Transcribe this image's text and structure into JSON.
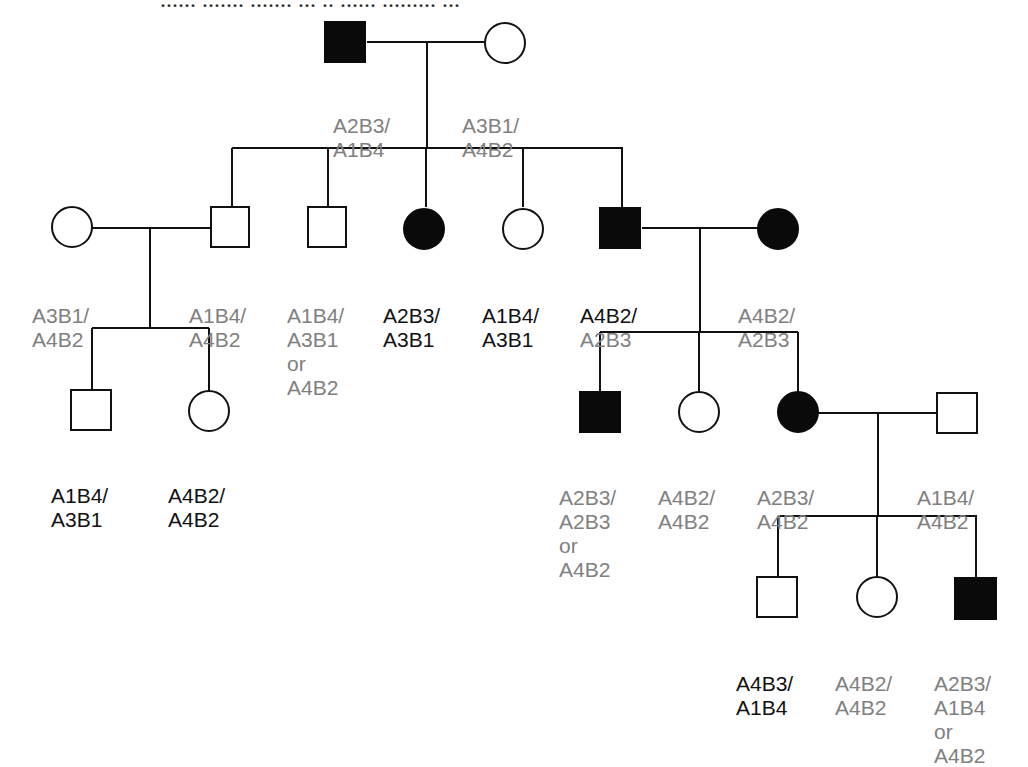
{
  "caption": "...... ....... ....... ... .. ...... ......... ...",
  "colors": {
    "line": "#111111",
    "affected": "#0a0a0a",
    "label_gray": "#808080",
    "label_black": "#111111"
  },
  "individuals": [
    {
      "id": "I1",
      "sex": "male",
      "affected": true,
      "genotype": [
        "A2B3/",
        "A1B4"
      ],
      "tone": [
        "gray",
        "gray"
      ]
    },
    {
      "id": "I2",
      "sex": "female",
      "affected": false,
      "genotype": [
        "A3B1/",
        "A4B2"
      ],
      "tone": [
        "gray",
        "gray"
      ]
    },
    {
      "id": "II1",
      "sex": "female",
      "affected": false,
      "genotype": [
        "A3B1/",
        "A4B2"
      ],
      "tone": [
        "gray",
        "gray"
      ]
    },
    {
      "id": "II2",
      "sex": "male",
      "affected": false,
      "genotype": [
        "A1B4/",
        "A4B2"
      ],
      "tone": [
        "gray",
        "gray"
      ]
    },
    {
      "id": "II3",
      "sex": "male",
      "affected": false,
      "genotype": [
        "A1B4/",
        "A3B1",
        "or",
        "A4B2"
      ],
      "tone": [
        "gray",
        "gray",
        "gray",
        "gray"
      ]
    },
    {
      "id": "II4",
      "sex": "female",
      "affected": true,
      "genotype": [
        "A2B3/",
        "A3B1"
      ],
      "tone": [
        "black",
        "black"
      ]
    },
    {
      "id": "II5",
      "sex": "female",
      "affected": false,
      "genotype": [
        "A1B4/",
        "A3B1"
      ],
      "tone": [
        "black",
        "black"
      ]
    },
    {
      "id": "II6",
      "sex": "male",
      "affected": true,
      "genotype": [
        "A4B2/",
        "A2B3"
      ],
      "tone": [
        "black",
        "gray"
      ]
    },
    {
      "id": "II7",
      "sex": "female",
      "affected": true,
      "genotype": [
        "A4B2/",
        "A2B3"
      ],
      "tone": [
        "gray",
        "gray"
      ]
    },
    {
      "id": "III1",
      "sex": "male",
      "affected": false,
      "genotype": [
        "A1B4/",
        "A3B1"
      ],
      "tone": [
        "black",
        "black"
      ]
    },
    {
      "id": "III2",
      "sex": "female",
      "affected": false,
      "genotype": [
        "A4B2/",
        "A4B2"
      ],
      "tone": [
        "black",
        "black"
      ]
    },
    {
      "id": "III3",
      "sex": "male",
      "affected": true,
      "genotype": [
        "A2B3/",
        "A2B3",
        "or",
        "A4B2"
      ],
      "tone": [
        "gray",
        "gray",
        "gray",
        "gray"
      ]
    },
    {
      "id": "III4",
      "sex": "female",
      "affected": false,
      "genotype": [
        "A4B2/",
        "A4B2"
      ],
      "tone": [
        "gray",
        "gray"
      ]
    },
    {
      "id": "III5",
      "sex": "female",
      "affected": true,
      "genotype": [
        "A2B3/",
        "A4B2"
      ],
      "tone": [
        "gray",
        "gray"
      ]
    },
    {
      "id": "III6",
      "sex": "male",
      "affected": false,
      "genotype": [
        "A1B4/",
        "A4B2"
      ],
      "tone": [
        "gray",
        "gray"
      ]
    },
    {
      "id": "IV1",
      "sex": "male",
      "affected": false,
      "genotype": [
        "A4B3/",
        "A1B4"
      ],
      "tone": [
        "black",
        "black"
      ]
    },
    {
      "id": "IV2",
      "sex": "female",
      "affected": false,
      "genotype": [
        "A4B2/",
        "A4B2"
      ],
      "tone": [
        "gray",
        "gray"
      ]
    },
    {
      "id": "IV3",
      "sex": "male",
      "affected": true,
      "genotype": [
        "A2B3/",
        "A1B4",
        "or",
        "A4B2"
      ],
      "tone": [
        "gray",
        "gray",
        "gray",
        "gray"
      ]
    }
  ]
}
